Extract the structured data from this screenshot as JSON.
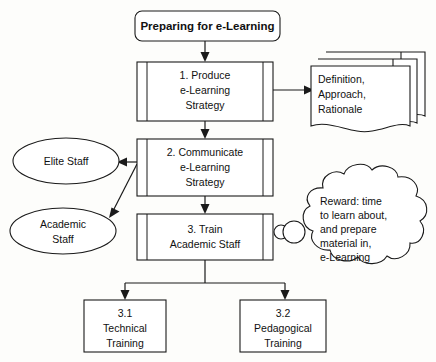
{
  "diagram": {
    "title_box": {
      "label": "Preparing for e-Learning",
      "shape": "rounded-rectangle"
    },
    "process_steps": [
      {
        "id": "step-1",
        "shape": "subprocess",
        "lines": [
          "1. Produce",
          "e-Learning",
          "Strategy"
        ]
      },
      {
        "id": "step-2",
        "shape": "subprocess",
        "lines": [
          "2. Communicate",
          "e-Learning",
          "Strategy"
        ]
      },
      {
        "id": "step-3",
        "shape": "subprocess",
        "lines": [
          "3. Train",
          "Academic Staff"
        ]
      }
    ],
    "sub_steps": [
      {
        "id": "step-3-1",
        "shape": "rectangle",
        "lines": [
          "3.1",
          "Technical",
          "Training"
        ]
      },
      {
        "id": "step-3-2",
        "shape": "rectangle",
        "lines": [
          "3.2",
          "Pedagogical",
          "Training"
        ]
      }
    ],
    "audiences": [
      {
        "id": "elite-staff",
        "shape": "ellipse",
        "lines": [
          "Elite Staff"
        ]
      },
      {
        "id": "academic-staff",
        "shape": "ellipse",
        "lines": [
          "Academic",
          "Staff"
        ]
      }
    ],
    "document_stack": {
      "id": "strategy-documents",
      "shape": "multi-document",
      "sheet_count": 3,
      "lines": [
        "Definition,",
        "Approach,",
        "Rationale"
      ]
    },
    "cloud_callout": {
      "id": "reward-cloud",
      "shape": "cloud",
      "lines": [
        "Reward: time",
        "to learn about,",
        "and prepare",
        "material in,",
        "e-Learning"
      ]
    },
    "colors": {
      "background": "#fdfdfb",
      "stroke": "#1a1a1a",
      "shape_fill": "#ffffff",
      "text": "#111111"
    }
  }
}
